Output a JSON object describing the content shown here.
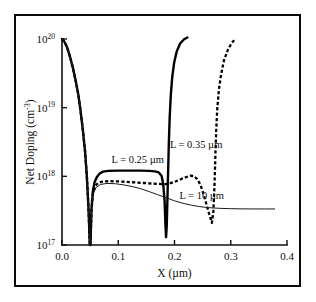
{
  "figure": {
    "background_color": "#ffffff",
    "frame_color": "#0a0a0a"
  },
  "chart_data": {
    "type": "line",
    "title": "",
    "xlabel": "X (µm)",
    "ylabel": "Net Doping (cm⁻³)",
    "xlim": [
      0.0,
      0.4
    ],
    "ylim": [
      1e+17,
      1e+20
    ],
    "yscale": "log",
    "grid": false,
    "legend_position": "inline-annotations",
    "x_ticks": [
      "0.0",
      "0.1",
      "0.2",
      "0.3",
      "0.4"
    ],
    "x_tick_values": [
      0.0,
      0.1,
      0.2,
      0.3,
      0.4
    ],
    "y_ticks": [
      "10",
      "10",
      "10",
      "10"
    ],
    "y_tick_exponents": [
      "20",
      "19",
      "18",
      "17"
    ],
    "y_tick_values": [
      1e+20,
      1e+19,
      1e+18,
      1e+17
    ],
    "annotations": [
      {
        "text": "L = 0.25 µm",
        "x": 0.088,
        "y": 1.55e+18
      },
      {
        "text": "L = 0.35 µm",
        "x": 0.285,
        "y": 2.6e+18
      },
      {
        "text": "L = 10 µm",
        "x": 0.288,
        "y": 4.6e+17
      }
    ],
    "series": [
      {
        "name": "L = 0.25 µm",
        "style": "solid-thick",
        "points": [
          [
            0.0,
            1e+20
          ],
          [
            0.004,
            9.2e+19
          ],
          [
            0.009,
            7.6e+19
          ],
          [
            0.014,
            5.6e+19
          ],
          [
            0.019,
            3.9e+19
          ],
          [
            0.024,
            2.55e+19
          ],
          [
            0.029,
            1.55e+19
          ],
          [
            0.033,
            9e+18
          ],
          [
            0.037,
            4.8e+18
          ],
          [
            0.041,
            2.3e+18
          ],
          [
            0.044,
            1.05e+18
          ],
          [
            0.047,
            3.6e+17
          ],
          [
            0.0495,
            1e+17
          ],
          [
            0.0505,
            1e+17
          ],
          [
            0.0525,
            3.4e+17
          ],
          [
            0.055,
            6.2e+17
          ],
          [
            0.058,
            8.3e+17
          ],
          [
            0.062,
            9.8e+17
          ],
          [
            0.067,
            1.1e+18
          ],
          [
            0.073,
            1.17e+18
          ],
          [
            0.082,
            1.2e+18
          ],
          [
            0.1,
            1.21e+18
          ],
          [
            0.12,
            1.21e+18
          ],
          [
            0.14,
            1.21e+18
          ],
          [
            0.155,
            1.2e+18
          ],
          [
            0.165,
            1.18e+18
          ],
          [
            0.172,
            1.14e+18
          ],
          [
            0.177,
            1.02e+18
          ],
          [
            0.18,
            7.6e+17
          ],
          [
            0.1825,
            4.2e+17
          ],
          [
            0.184,
            1.9e+17
          ],
          [
            0.185,
            1.3e+17
          ],
          [
            0.1862,
            1.9e+17
          ],
          [
            0.1875,
            5e+17
          ],
          [
            0.1888,
            1.3e+18
          ],
          [
            0.19,
            3.2e+18
          ],
          [
            0.1915,
            7.4e+18
          ],
          [
            0.1935,
            1.55e+19
          ],
          [
            0.196,
            2.8e+19
          ],
          [
            0.1995,
            4.6e+19
          ],
          [
            0.204,
            6.6e+19
          ],
          [
            0.21,
            8.6e+19
          ],
          [
            0.217,
            9.9e+19
          ],
          [
            0.223,
            1.05e+20
          ]
        ]
      },
      {
        "name": "L = 0.35 µm",
        "style": "dashed",
        "points": [
          [
            0.0,
            1e+20
          ],
          [
            0.004,
            9.2e+19
          ],
          [
            0.009,
            7.6e+19
          ],
          [
            0.014,
            5.6e+19
          ],
          [
            0.019,
            3.9e+19
          ],
          [
            0.024,
            2.55e+19
          ],
          [
            0.029,
            1.55e+19
          ],
          [
            0.033,
            9e+18
          ],
          [
            0.037,
            4.8e+18
          ],
          [
            0.041,
            2.3e+18
          ],
          [
            0.044,
            1.05e+18
          ],
          [
            0.047,
            3.6e+17
          ],
          [
            0.0495,
            1e+17
          ],
          [
            0.0505,
            1e+17
          ],
          [
            0.0525,
            3.2e+17
          ],
          [
            0.055,
            5.6e+17
          ],
          [
            0.059,
            7.2e+17
          ],
          [
            0.064,
            8e+17
          ],
          [
            0.072,
            8.4e+17
          ],
          [
            0.085,
            8.5e+17
          ],
          [
            0.105,
            8.4e+17
          ],
          [
            0.125,
            8.2e+17
          ],
          [
            0.145,
            8e+17
          ],
          [
            0.165,
            7.8e+17
          ],
          [
            0.18,
            7.7e+17
          ],
          [
            0.19,
            7.8e+17
          ],
          [
            0.2,
            8.3e+17
          ],
          [
            0.21,
            9e+17
          ],
          [
            0.22,
            9.7e+17
          ],
          [
            0.228,
            1.02e+18
          ],
          [
            0.234,
            1.01e+18
          ],
          [
            0.24,
            9.2e+17
          ],
          [
            0.246,
            7.6e+17
          ],
          [
            0.252,
            5.4e+17
          ],
          [
            0.258,
            3.6e+17
          ],
          [
            0.263,
            2.6e+17
          ],
          [
            0.2665,
            2.1e+17
          ],
          [
            0.269,
            3e+17
          ],
          [
            0.271,
            7e+17
          ],
          [
            0.2725,
            1.8e+18
          ],
          [
            0.274,
            4.4e+18
          ],
          [
            0.276,
            9.6e+18
          ],
          [
            0.279,
            1.85e+19
          ],
          [
            0.283,
            3.1e+19
          ],
          [
            0.288,
            4.9e+19
          ],
          [
            0.295,
            7e+19
          ],
          [
            0.302,
            8.8e+19
          ],
          [
            0.309,
            1.02e+20
          ]
        ]
      },
      {
        "name": "L = 10 µm",
        "style": "thin-solid",
        "points": [
          [
            0.0,
            1e+20
          ],
          [
            0.004,
            9.2e+19
          ],
          [
            0.009,
            7.6e+19
          ],
          [
            0.014,
            5.6e+19
          ],
          [
            0.019,
            3.9e+19
          ],
          [
            0.024,
            2.55e+19
          ],
          [
            0.029,
            1.55e+19
          ],
          [
            0.033,
            9e+18
          ],
          [
            0.037,
            4.8e+18
          ],
          [
            0.041,
            2.3e+18
          ],
          [
            0.044,
            1.05e+18
          ],
          [
            0.047,
            3.6e+17
          ],
          [
            0.0495,
            1e+17
          ],
          [
            0.0505,
            1e+17
          ],
          [
            0.0525,
            3.2e+17
          ],
          [
            0.055,
            5.4e+17
          ],
          [
            0.06,
            6.8e+17
          ],
          [
            0.068,
            7.6e+17
          ],
          [
            0.08,
            7.9e+17
          ],
          [
            0.095,
            7.8e+17
          ],
          [
            0.11,
            7.5e+17
          ],
          [
            0.125,
            7.1e+17
          ],
          [
            0.14,
            6.6e+17
          ],
          [
            0.155,
            6e+17
          ],
          [
            0.17,
            5.4e+17
          ],
          [
            0.185,
            4.9e+17
          ],
          [
            0.2,
            4.4e+17
          ],
          [
            0.215,
            4.05e+17
          ],
          [
            0.23,
            3.8e+17
          ],
          [
            0.245,
            3.62e+17
          ],
          [
            0.26,
            3.5e+17
          ],
          [
            0.28,
            3.42e+17
          ],
          [
            0.3,
            3.38e+17
          ],
          [
            0.32,
            3.36e+17
          ],
          [
            0.34,
            3.35e+17
          ],
          [
            0.36,
            3.35e+17
          ],
          [
            0.378,
            3.35e+17
          ]
        ]
      }
    ]
  }
}
